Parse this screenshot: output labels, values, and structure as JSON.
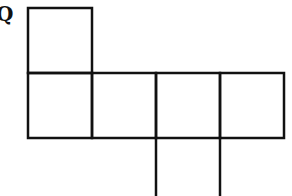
{
  "figure": {
    "label": "Q",
    "stroke_color": "#111111",
    "background": "#ffffff",
    "cell_size": 64,
    "squares": [
      {
        "id": "top",
        "row": 0,
        "col": 0
      },
      {
        "id": "middle-1",
        "row": 1,
        "col": 0
      },
      {
        "id": "middle-2",
        "row": 1,
        "col": 1
      },
      {
        "id": "middle-3",
        "row": 1,
        "col": 2
      },
      {
        "id": "middle-4",
        "row": 1,
        "col": 3
      },
      {
        "id": "bottom",
        "row": 2,
        "col": 2,
        "clipped": true
      }
    ]
  }
}
